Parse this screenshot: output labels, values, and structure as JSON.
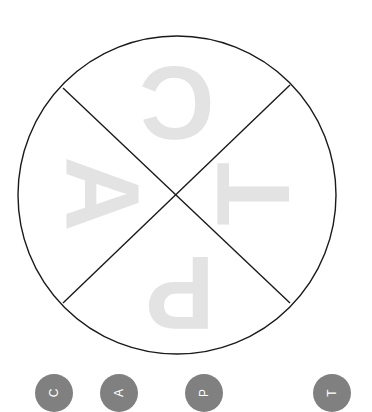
{
  "canvas": {
    "background": "#ffffff",
    "width": 372,
    "height": 400
  },
  "diagram": {
    "name": "capt-wheel",
    "shape": "circle-quartered-by-x-cross",
    "stroke_color": "#1a1a1a",
    "stroke_width": 1.4,
    "fill": "#ffffff",
    "center": {
      "x": 177,
      "y": 195
    },
    "radius": 159,
    "letter_color": "#e3e3e3",
    "quadrants": [
      {
        "id": "top",
        "letter": "C",
        "rotation_deg": 180,
        "cx": 177,
        "cy": 103
      },
      {
        "id": "left",
        "letter": "A",
        "rotation_deg": 90,
        "cx": 103,
        "cy": 194
      },
      {
        "id": "right",
        "letter": "T",
        "rotation_deg": 270,
        "cx": 253,
        "cy": 194
      },
      {
        "id": "bottom",
        "letter": "P",
        "rotation_deg": 180,
        "cx": 180,
        "cy": 293
      }
    ],
    "cross_lines": [
      {
        "id": "cross-line-nw-se",
        "x1": 63,
        "y1": 88,
        "x2": 290,
        "y2": 303
      },
      {
        "id": "cross-line-ne-sw",
        "x1": 290,
        "y1": 85,
        "x2": 63,
        "y2": 303
      }
    ]
  },
  "badges": {
    "color": "#808080",
    "text_color": "#ffffff",
    "items": [
      {
        "label": "C"
      },
      {
        "label": "A"
      },
      {
        "label": "P"
      },
      {
        "label": "T"
      }
    ]
  }
}
